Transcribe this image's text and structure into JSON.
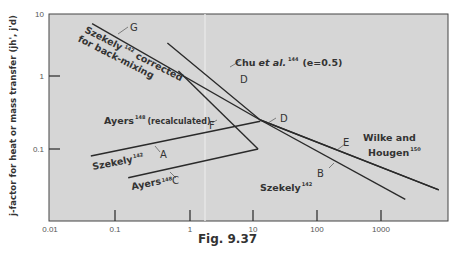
{
  "caption": "Fig. 9.37",
  "chart_data": {
    "type": "line",
    "title": "",
    "xlabel": "",
    "ylabel": "j-factor for heat or mass transfer (jh', j'd)",
    "xscale": "log",
    "yscale": "log",
    "xlim": [
      0.01,
      10000
    ],
    "ylim": [
      0.01,
      10
    ],
    "x_ticks": [
      "0.01",
      "0.1",
      "1",
      "10",
      "100",
      "1000"
    ],
    "y_ticks": [
      "10",
      "1",
      "0.1"
    ],
    "grid": false,
    "series": [
      {
        "name": "G",
        "label": "Szekely corrected for back-mixing",
        "ref": "142",
        "points": [
          [
            0.045,
            7.0
          ],
          [
            13,
            0.25
          ]
        ]
      },
      {
        "name": "D",
        "label": "Chu et al. (e=0.5)",
        "ref": "144",
        "points": [
          [
            0.5,
            3.4
          ],
          [
            13,
            0.25
          ],
          [
            8000,
            0.027
          ]
        ]
      },
      {
        "name": "F",
        "label": "Ayers (recalculated)",
        "ref": "148",
        "points": [
          [
            0.7,
            1.2
          ],
          [
            12,
            0.1
          ]
        ]
      },
      {
        "name": "A",
        "label": "Szekely",
        "ref": "142",
        "points": [
          [
            0.043,
            0.08
          ],
          [
            13,
            0.24
          ]
        ]
      },
      {
        "name": "C",
        "label": "Ayers",
        "ref": "148",
        "points": [
          [
            0.15,
            0.04
          ],
          [
            12,
            0.1
          ]
        ]
      },
      {
        "name": "B",
        "label": "Szekely",
        "ref": "142",
        "points": [
          [
            13,
            0.25
          ],
          [
            2400,
            0.02
          ]
        ]
      },
      {
        "name": "E",
        "label": "Wilke and Hougen",
        "ref": "150",
        "points": [
          [
            13,
            0.25
          ],
          [
            8000,
            0.027
          ]
        ]
      }
    ],
    "annotations": [
      {
        "text": "Szekely",
        "sup": "142",
        "extra": "corrected for back-mixing"
      },
      {
        "text": "Chu et al.",
        "sup": "144",
        "extra": "(e=0.5)"
      },
      {
        "text": "Ayers",
        "sup": "148",
        "extra": "(recalculated)"
      },
      {
        "text": "Szekely",
        "sup": "142"
      },
      {
        "text": "Ayers",
        "sup": "148"
      },
      {
        "text": "Szekely",
        "sup": "142"
      },
      {
        "text": "Wilke and",
        "extra": "Hougen",
        "sup": "150"
      }
    ]
  },
  "labels": {
    "g_text_line1": "Szekely",
    "g_sup": "142",
    "g_text_line1b": "corrected",
    "g_text_line2": "for back-mixing",
    "chu_text": "Chu",
    "chu_etal": "et al.",
    "chu_sup": "144",
    "chu_e": "(e=0.5)",
    "ayers_recalc": "Ayers",
    "ayers_recalc_sup": "148",
    "ayers_recalc_extra": "(recalculated)",
    "szekely_a": "Szekely",
    "szekely_a_sup": "142",
    "ayers_c": "Ayers",
    "ayers_c_sup": "148",
    "szekely_b": "Szekely",
    "szekely_b_sup": "142",
    "wilke_line1": "Wilke and",
    "wilke_line2": "Hougen",
    "wilke_sup": "150",
    "letter_G": "G",
    "letter_D1": "D",
    "letter_D2": "D",
    "letter_F": "F",
    "letter_A": "A",
    "letter_C": "C",
    "letter_B": "B",
    "letter_E": "E"
  },
  "colors": {
    "plot_bg": "#d6d6d6",
    "line": "#2a2a2a",
    "axis": "#444444",
    "text": "#333333"
  }
}
